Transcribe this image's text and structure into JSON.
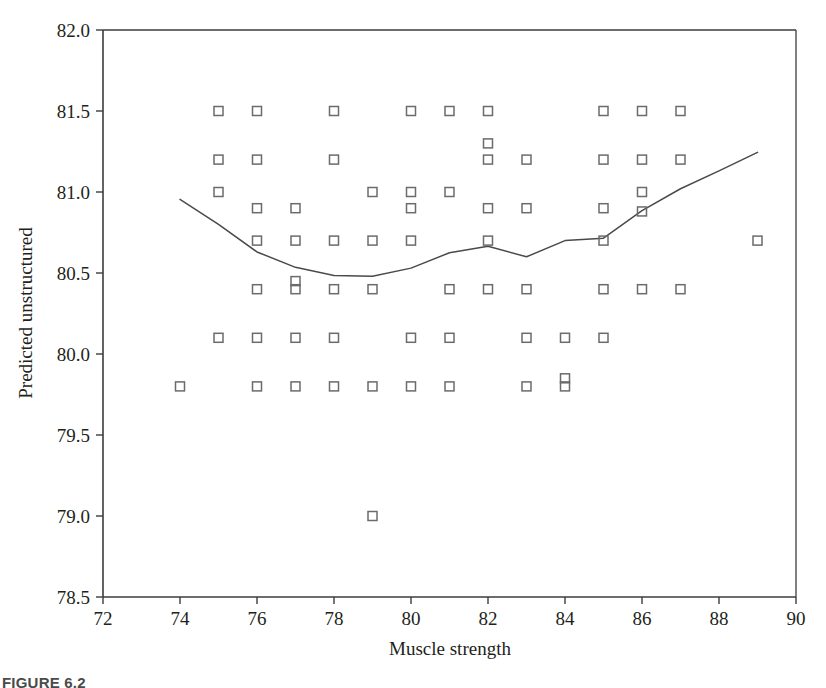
{
  "figure": {
    "caption": "FIGURE 6.2",
    "background_color": "#ffffff",
    "axis_color": "#3c3c3c",
    "marker_color": "#6b6b6b",
    "line_color": "#4a4a4a"
  },
  "chart_data": {
    "type": "scatter",
    "title": "",
    "xlabel": "Muscle strength",
    "ylabel": "Predicted unstructured",
    "xlim": [
      72,
      90
    ],
    "ylim": [
      78.5,
      82.0
    ],
    "xticks": [
      72,
      74,
      76,
      78,
      80,
      82,
      84,
      86,
      88,
      90
    ],
    "xtick_labels": [
      "72",
      "74",
      "76",
      "78",
      "80",
      "82",
      "84",
      "86",
      "88",
      "90"
    ],
    "yticks": [
      78.5,
      79.0,
      79.5,
      80.0,
      80.5,
      81.0,
      81.5,
      82.0
    ],
    "ytick_labels": [
      "78.5",
      "79.0",
      "79.5",
      "80.0",
      "80.5",
      "81.0",
      "81.5",
      "82.0"
    ],
    "grid": false,
    "legend": null,
    "marker": "open-square",
    "series": [
      {
        "name": "observations",
        "type": "scatter",
        "points": [
          [
            75,
            81.5
          ],
          [
            76,
            81.5
          ],
          [
            78,
            81.5
          ],
          [
            80,
            81.5
          ],
          [
            81,
            81.5
          ],
          [
            82,
            81.5
          ],
          [
            85,
            81.5
          ],
          [
            86,
            81.5
          ],
          [
            87,
            81.5
          ],
          [
            82,
            81.3
          ],
          [
            75,
            81.2
          ],
          [
            76,
            81.2
          ],
          [
            78,
            81.2
          ],
          [
            82,
            81.2
          ],
          [
            83,
            81.2
          ],
          [
            85,
            81.2
          ],
          [
            86,
            81.2
          ],
          [
            87,
            81.2
          ],
          [
            75,
            81.0
          ],
          [
            79,
            81.0
          ],
          [
            80,
            81.0
          ],
          [
            81,
            81.0
          ],
          [
            86,
            81.0
          ],
          [
            76,
            80.9
          ],
          [
            77,
            80.9
          ],
          [
            80,
            80.9
          ],
          [
            82,
            80.9
          ],
          [
            83,
            80.9
          ],
          [
            85,
            80.9
          ],
          [
            86,
            80.88
          ],
          [
            76,
            80.7
          ],
          [
            77,
            80.7
          ],
          [
            78,
            80.7
          ],
          [
            79,
            80.7
          ],
          [
            80,
            80.7
          ],
          [
            82,
            80.7
          ],
          [
            85,
            80.7
          ],
          [
            89,
            80.7
          ],
          [
            77,
            80.45
          ],
          [
            76,
            80.4
          ],
          [
            77,
            80.4
          ],
          [
            78,
            80.4
          ],
          [
            79,
            80.4
          ],
          [
            81,
            80.4
          ],
          [
            82,
            80.4
          ],
          [
            83,
            80.4
          ],
          [
            85,
            80.4
          ],
          [
            86,
            80.4
          ],
          [
            87,
            80.4
          ],
          [
            75,
            80.1
          ],
          [
            76,
            80.1
          ],
          [
            77,
            80.1
          ],
          [
            78,
            80.1
          ],
          [
            80,
            80.1
          ],
          [
            81,
            80.1
          ],
          [
            83,
            80.1
          ],
          [
            84,
            80.1
          ],
          [
            85,
            80.1
          ],
          [
            84,
            79.85
          ],
          [
            74,
            79.8
          ],
          [
            76,
            79.8
          ],
          [
            77,
            79.8
          ],
          [
            78,
            79.8
          ],
          [
            79,
            79.8
          ],
          [
            80,
            79.8
          ],
          [
            81,
            79.8
          ],
          [
            83,
            79.8
          ],
          [
            84,
            79.8
          ],
          [
            79,
            79.0
          ]
        ]
      },
      {
        "name": "smoothed-fit",
        "type": "line",
        "points": [
          [
            74.0,
            80.955
          ],
          [
            75.0,
            80.8
          ],
          [
            76.0,
            80.63
          ],
          [
            77.0,
            80.535
          ],
          [
            78.0,
            80.485
          ],
          [
            79.0,
            80.48
          ],
          [
            80.0,
            80.53
          ],
          [
            81.0,
            80.625
          ],
          [
            82.0,
            80.665
          ],
          [
            83.0,
            80.6
          ],
          [
            84.0,
            80.7
          ],
          [
            85.0,
            80.715
          ],
          [
            86.0,
            80.885
          ],
          [
            87.0,
            81.02
          ],
          [
            88.0,
            81.13
          ],
          [
            89.0,
            81.245
          ]
        ]
      }
    ]
  }
}
